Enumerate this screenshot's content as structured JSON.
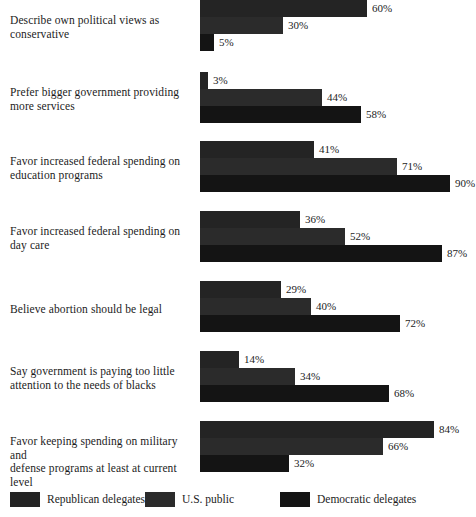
{
  "chart_data": {
    "type": "bar",
    "orientation": "horizontal",
    "title": "",
    "subtitle": "",
    "xlabel": "",
    "ylabel": "",
    "xlim": [
      0,
      100
    ],
    "grid": false,
    "legend_position": "bottom",
    "value_suffix": "%",
    "categories": [
      "Describe own political views as conservative",
      "Prefer bigger government providing more services",
      "Favor increased federal spending on education programs",
      "Favor increased federal spending on day care",
      "Believe abortion should be legal",
      "Say government is paying too little attention to the needs of blacks",
      "Favor keeping spending on military and defense programs at least at current level"
    ],
    "series": [
      {
        "name": "Republican delegates",
        "color": "#242424",
        "values": [
          60,
          3,
          41,
          36,
          29,
          14,
          84
        ]
      },
      {
        "name": "U.S. public",
        "color": "#2b2b2b",
        "values": [
          30,
          44,
          71,
          52,
          40,
          34,
          66
        ]
      },
      {
        "name": "Democratic delegates",
        "color": "#141414",
        "values": [
          5,
          58,
          90,
          87,
          72,
          68,
          32
        ]
      }
    ],
    "data_labels": [
      [
        "60%",
        "30%",
        "5%"
      ],
      [
        "3%",
        "44%",
        "58%"
      ],
      [
        "41%",
        "71%",
        "90%"
      ],
      [
        "36%",
        "52%",
        "87%"
      ],
      [
        "29%",
        "40%",
        "72%"
      ],
      [
        "14%",
        "34%",
        "68%"
      ],
      [
        "84%",
        "66%",
        "32%"
      ]
    ]
  },
  "groups": [
    {
      "label_line1": "Describe own political views as",
      "label_line2": "conservative"
    },
    {
      "label_line1": "Prefer bigger government providing",
      "label_line2": "more services"
    },
    {
      "label_line1": "Favor increased federal spending on",
      "label_line2": "education programs"
    },
    {
      "label_line1": "Favor increased federal spending on",
      "label_line2": "day care"
    },
    {
      "label_line1": "Believe abortion should be legal",
      "label_line2": ""
    },
    {
      "label_line1": "Say government is paying too little",
      "label_line2": "attention to the needs of blacks"
    },
    {
      "label_line1": "Favor keeping spending on military and",
      "label_line2": "defense programs at least at current level"
    }
  ],
  "legend": {
    "items": [
      {
        "label": "Republican delegates"
      },
      {
        "label": "U.S. public"
      },
      {
        "label": "Democratic delegates"
      }
    ]
  }
}
